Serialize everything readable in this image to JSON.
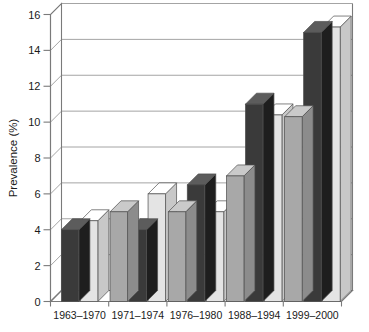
{
  "chart_data": {
    "type": "bar",
    "title": "",
    "xlabel": "",
    "ylabel": "Prevalence (%)",
    "ylim": [
      0,
      16
    ],
    "yticks": [
      0,
      2,
      4,
      6,
      8,
      10,
      12,
      14,
      16
    ],
    "ytick_labels": [
      "0",
      "2",
      "4",
      "6",
      "8",
      "10",
      "12",
      "14",
      "16"
    ],
    "grid": true,
    "grid_axis": "y",
    "legend": "none",
    "style": "3d-bar",
    "categories": [
      "1963–1970",
      "1971–1974",
      "1976–1980",
      "1988–1994",
      "1999–2000"
    ],
    "series": [
      {
        "name": "gray",
        "color": "#a8a8a8",
        "values": [
          null,
          5.0,
          5.0,
          7.0,
          10.3
        ]
      },
      {
        "name": "dark",
        "color": "#3a3a3a",
        "values": [
          4.0,
          4.0,
          6.5,
          11.0,
          15.0
        ]
      },
      {
        "name": "light",
        "color": "#e4e4e4",
        "values": [
          4.5,
          6.0,
          5.0,
          10.4,
          15.3
        ]
      }
    ],
    "bars": [
      {
        "category": "1963–1970",
        "series": "dark",
        "value": 4.0
      },
      {
        "category": "1963–1970",
        "series": "light",
        "value": 4.5
      },
      {
        "category": "1971–1974",
        "series": "gray",
        "value": 5.0
      },
      {
        "category": "1971–1974",
        "series": "dark",
        "value": 4.0
      },
      {
        "category": "1971–1974",
        "series": "light",
        "value": 6.0
      },
      {
        "category": "1976–1980",
        "series": "gray",
        "value": 5.0
      },
      {
        "category": "1976–1980",
        "series": "dark",
        "value": 6.5
      },
      {
        "category": "1976–1980",
        "series": "light",
        "value": 5.0
      },
      {
        "category": "1988–1994",
        "series": "gray",
        "value": 7.0
      },
      {
        "category": "1988–1994",
        "series": "dark",
        "value": 11.0
      },
      {
        "category": "1988–1994",
        "series": "light",
        "value": 10.4
      },
      {
        "category": "1999–2000",
        "series": "gray",
        "value": 10.3
      },
      {
        "category": "1999–2000",
        "series": "dark",
        "value": 15.0
      },
      {
        "category": "1999–2000",
        "series": "light",
        "value": 15.3
      }
    ],
    "colors": {
      "gray": "#a8a8a8",
      "dark": "#3a3a3a",
      "light": "#e4e4e4",
      "grid": "#9a9a9a",
      "axis": "#7a7a7a",
      "text": "#1a1a1a",
      "background": "#ffffff"
    }
  }
}
